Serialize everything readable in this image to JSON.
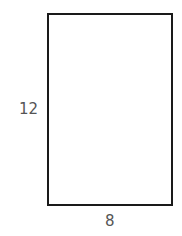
{
  "diagram": {
    "shape": "rectangle",
    "height_label": "12",
    "width_label": "8",
    "stroke_color": "#1a1a1a",
    "label_color": "#555555"
  }
}
